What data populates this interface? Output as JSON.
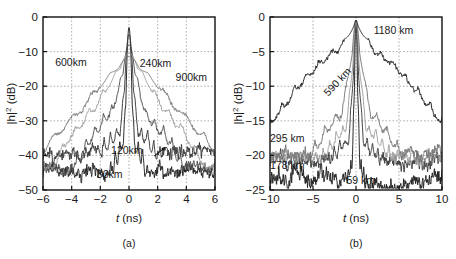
{
  "figure": {
    "background": "#ffffff",
    "panels": [
      {
        "id": "a",
        "caption": "(a)",
        "xlabel_italic": "t",
        "xlabel_unit": " (ns)",
        "ylabel": "|h|² (dB)"
      },
      {
        "id": "b",
        "caption": "(b)",
        "xlabel_italic": "t",
        "xlabel_unit": " (ns)",
        "ylabel": "|h|² (dB)"
      }
    ]
  },
  "chart_data": [
    {
      "type": "line",
      "panel": "a",
      "title": "",
      "xlabel": "t (ns)",
      "ylabel": "|h|² (dB)",
      "xlim": [
        -6,
        6
      ],
      "ylim": [
        -50,
        0
      ],
      "xticks": [
        -6,
        -4,
        -2,
        0,
        2,
        4,
        6
      ],
      "xticklabels": [
        "−6",
        "−4",
        "−2",
        "0",
        "2",
        "4",
        "6"
      ],
      "yticks": [
        -50,
        -40,
        -30,
        -20,
        -10,
        0
      ],
      "yticklabels": [
        "−50",
        "−40",
        "−30",
        "−20",
        "−10",
        "0"
      ],
      "grid": true,
      "legend": "annotations-on-curves",
      "series": [
        {
          "name": "30km",
          "color": "#242424",
          "peak_db": -3.0,
          "core_halfwidth_ns": 0.18,
          "shoulder_halfwidth_ns": 1.6,
          "shoulder_db": -33.0,
          "noise_floor_db": -44.5,
          "noise_amp_db": 1.3,
          "ripple_count": 5,
          "ripple_depth_db": 7.0,
          "seed": 11
        },
        {
          "name": "120km",
          "color": "#3a3a3a",
          "peak_db": -5.0,
          "core_halfwidth_ns": 0.3,
          "shoulder_halfwidth_ns": 2.6,
          "shoulder_db": -30.0,
          "noise_floor_db": -39.5,
          "noise_amp_db": 1.2,
          "ripple_count": 6,
          "ripple_depth_db": 6.0,
          "seed": 23
        },
        {
          "name": "240km",
          "color": "#4d4d4d",
          "peak_db": -8.0,
          "core_halfwidth_ns": 0.55,
          "shoulder_halfwidth_ns": 4.2,
          "shoulder_db": -23.0,
          "noise_floor_db": -44.0,
          "noise_amp_db": 1.1,
          "ripple_count": 7,
          "ripple_depth_db": 4.5,
          "seed": 37
        },
        {
          "name": "600km",
          "color": "#9b9b9b",
          "peak_db": -10.5,
          "core_halfwidth_ns": 1.1,
          "shoulder_halfwidth_ns": 5.6,
          "shoulder_db": -18.5,
          "noise_floor_db": -43.0,
          "noise_amp_db": 1.0,
          "ripple_count": 6,
          "ripple_depth_db": 3.0,
          "seed": 53
        },
        {
          "name": "900km",
          "color": "#767676",
          "peak_db": -11.5,
          "core_halfwidth_ns": 1.5,
          "shoulder_halfwidth_ns": 6.6,
          "shoulder_db": -17.0,
          "noise_floor_db": -41.0,
          "noise_amp_db": 0.9,
          "ripple_count": 5,
          "ripple_depth_db": 2.4,
          "seed": 71
        }
      ],
      "annotations": [
        {
          "text": "600km",
          "x": -4.05,
          "y": -14.2,
          "color": "#9b9b9b",
          "rotate": 0,
          "anchor": "middle"
        },
        {
          "text": "240km",
          "x": 1.85,
          "y": -14.4,
          "color": "#333333",
          "rotate": 0,
          "anchor": "middle"
        },
        {
          "text": "900km",
          "x": 4.35,
          "y": -18.6,
          "color": "#6e6e6e",
          "rotate": 0,
          "anchor": "middle"
        },
        {
          "text": "120km",
          "x": -0.15,
          "y": -39.5,
          "color": "#6e6e6e",
          "rotate": 0,
          "anchor": "middle"
        },
        {
          "text": "30km",
          "x": -1.35,
          "y": -46.6,
          "color": "#272727",
          "rotate": 0,
          "anchor": "middle"
        }
      ],
      "arrows": [
        {
          "from_x": 1.75,
          "from_y": -40.2,
          "to_x": 2.55,
          "to_y": -37.6
        }
      ]
    },
    {
      "type": "line",
      "panel": "b",
      "title": "",
      "xlabel": "t (ns)",
      "ylabel": "|h|² (dB)",
      "xlim": [
        -10,
        10
      ],
      "ylim": [
        -25,
        0
      ],
      "xticks": [
        -10,
        -5,
        0,
        5,
        10
      ],
      "xticklabels": [
        "−10",
        "−5",
        "0",
        "5",
        "10"
      ],
      "yticks": [
        -25,
        -20,
        -15,
        -10,
        -5,
        0
      ],
      "yticklabels": [
        "−25",
        "−20",
        "−15",
        "−10",
        "−5",
        "0"
      ],
      "grid": true,
      "legend": "annotations-on-curves",
      "series": [
        {
          "name": "59 km",
          "color": "#202020",
          "peak_db": -0.4,
          "core_halfwidth_ns": 0.22,
          "shoulder_halfwidth_ns": 1.5,
          "shoulder_db": -19.5,
          "noise_floor_db": -23.6,
          "noise_amp_db": 0.9,
          "ripple_count": 5,
          "ripple_depth_db": 3.2,
          "seed": 101
        },
        {
          "name": "178 km",
          "color": "#3d3d3d",
          "peak_db": -0.6,
          "core_halfwidth_ns": 0.4,
          "shoulder_halfwidth_ns": 3.8,
          "shoulder_db": -16.5,
          "noise_floor_db": -20.6,
          "noise_amp_db": 0.7,
          "ripple_count": 6,
          "ripple_depth_db": 2.8,
          "seed": 113
        },
        {
          "name": "295 km",
          "color": "#9e9e9e",
          "peak_db": -0.7,
          "core_halfwidth_ns": 0.55,
          "shoulder_halfwidth_ns": 4.6,
          "shoulder_db": -14.5,
          "noise_floor_db": -20.2,
          "noise_amp_db": 0.6,
          "ripple_count": 6,
          "ripple_depth_db": 2.5,
          "seed": 127
        },
        {
          "name": "590 km",
          "color": "#757575",
          "peak_db": -0.8,
          "core_halfwidth_ns": 0.8,
          "shoulder_halfwidth_ns": 6.0,
          "shoulder_db": -12.0,
          "noise_floor_db": -20.0,
          "noise_amp_db": 0.6,
          "ripple_count": 5,
          "ripple_depth_db": 2.2,
          "seed": 139
        },
        {
          "name": "1180 km",
          "color": "#1f1f1f",
          "peak_db": -0.5,
          "core_halfwidth_ns": 1.0,
          "shoulder_halfwidth_ns": 11.5,
          "shoulder_db": -3.5,
          "noise_floor_db": -17.5,
          "noise_amp_db": 0.55,
          "ripple_count": 8,
          "ripple_depth_db": 1.4,
          "seed": 151
        }
      ],
      "annotations": [
        {
          "text": "1180 km",
          "x": 4.35,
          "y": -2.45,
          "color": "#202020",
          "rotate": 0,
          "anchor": "middle"
        },
        {
          "text": "590 km",
          "x": -1.85,
          "y": -9.7,
          "color": "#7a7a7a",
          "rotate": -47,
          "anchor": "middle"
        },
        {
          "text": "295 km",
          "x": -8.0,
          "y": -18.1,
          "color": "#9e9e9e",
          "rotate": 0,
          "anchor": "middle"
        },
        {
          "text": "178 km",
          "x": -8.0,
          "y": -22.0,
          "color": "#4a4a4a",
          "rotate": 0,
          "anchor": "middle"
        },
        {
          "text": "59 km",
          "x": 0.55,
          "y": -24.2,
          "color": "#202020",
          "rotate": 0,
          "anchor": "middle"
        }
      ],
      "arrows": []
    }
  ]
}
